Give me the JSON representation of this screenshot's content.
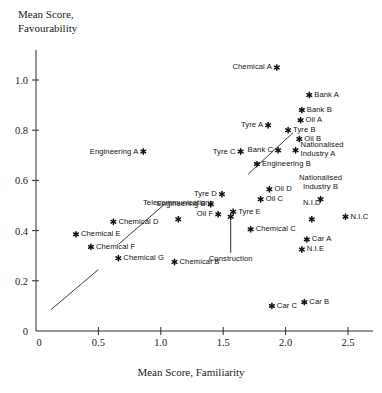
{
  "chart_data": {
    "type": "scatter",
    "title": "",
    "ylabel_line1": "Mean Score,",
    "ylabel_line2": "Favourability",
    "xlabel": "Mean Score, Familiarity",
    "xlim": [
      0,
      2.7
    ],
    "ylim": [
      0,
      1.12
    ],
    "xticks": [
      0,
      0.5,
      1.0,
      1.5,
      2.0,
      2.5
    ],
    "xtick_labels": [
      "0",
      "0.5",
      "1.0",
      "1.5",
      "2.0",
      "2.5"
    ],
    "yticks": [
      0,
      0.2,
      0.4,
      0.6,
      0.8,
      1.0
    ],
    "ytick_labels": [
      "0",
      "0.2",
      "0.4",
      "0.6",
      "0.8",
      "1.0"
    ],
    "grid": false,
    "legend": "none",
    "marker": "asterisk",
    "trend_line": {
      "style": "dashed",
      "note": "broken diagonal reference line from lower-left to upper-right"
    },
    "points": [
      {
        "label": "Chemical A",
        "x": 1.93,
        "y": 1.05,
        "lpos": "left"
      },
      {
        "label": "Bank A",
        "x": 2.19,
        "y": 0.94,
        "lpos": "right"
      },
      {
        "label": "Bank B",
        "x": 2.13,
        "y": 0.88,
        "lpos": "right"
      },
      {
        "label": "Oil A",
        "x": 2.12,
        "y": 0.84,
        "lpos": "right"
      },
      {
        "label": "Tyre B",
        "x": 2.02,
        "y": 0.8,
        "lpos": "right"
      },
      {
        "label": "Tyre A",
        "x": 1.86,
        "y": 0.82,
        "lpos": "left"
      },
      {
        "label": "Oil B",
        "x": 2.11,
        "y": 0.765,
        "lpos": "right"
      },
      {
        "label": "Bank C",
        "x": 1.94,
        "y": 0.72,
        "lpos": "left"
      },
      {
        "label": "Tyre C",
        "x": 1.64,
        "y": 0.715,
        "lpos": "left"
      },
      {
        "label": "Nationalised\nIndustry A",
        "x": 2.08,
        "y": 0.72,
        "lpos": "right"
      },
      {
        "label": "Engineering A",
        "x": 0.86,
        "y": 0.715,
        "lpos": "left"
      },
      {
        "label": "Engineering B",
        "x": 1.77,
        "y": 0.665,
        "lpos": "right"
      },
      {
        "label": "Oil D",
        "x": 1.87,
        "y": 0.565,
        "lpos": "right"
      },
      {
        "label": "Nationalised\nIndustry B",
        "x": 2.28,
        "y": 0.525,
        "lpos": "center"
      },
      {
        "label": "Tyre D",
        "x": 1.49,
        "y": 0.545,
        "lpos": "left"
      },
      {
        "label": "Oil C",
        "x": 1.8,
        "y": 0.525,
        "lpos": "right"
      },
      {
        "label": "Engineering B",
        "x": 1.4,
        "y": 0.505,
        "lpos": "left"
      },
      {
        "label": "Tyre E",
        "x": 1.58,
        "y": 0.475,
        "lpos": "right"
      },
      {
        "label": "N.I.C",
        "x": 2.48,
        "y": 0.455,
        "lpos": "right"
      },
      {
        "label": "Oil F",
        "x": 1.46,
        "y": 0.465,
        "lpos": "left"
      },
      {
        "label": "N.I.D",
        "x": 2.21,
        "y": 0.445,
        "lpos": "center"
      },
      {
        "label": "Telecommunications",
        "x": 1.14,
        "y": 0.445,
        "lpos": "center"
      },
      {
        "label": "Chemical D",
        "x": 0.62,
        "y": 0.435,
        "lpos": "right"
      },
      {
        "label": "Chemical C",
        "x": 1.72,
        "y": 0.405,
        "lpos": "right"
      },
      {
        "label": "Chemical E",
        "x": 0.32,
        "y": 0.385,
        "lpos": "right"
      },
      {
        "label": "Car A",
        "x": 2.17,
        "y": 0.365,
        "lpos": "right"
      },
      {
        "label": "Chemical F",
        "x": 0.44,
        "y": 0.335,
        "lpos": "right"
      },
      {
        "label": "N.I.E",
        "x": 2.13,
        "y": 0.325,
        "lpos": "right"
      },
      {
        "label": "Chemical G",
        "x": 0.66,
        "y": 0.29,
        "lpos": "right"
      },
      {
        "label": "Chemical B",
        "x": 1.11,
        "y": 0.275,
        "lpos": "right"
      },
      {
        "label": "Car C",
        "x": 1.89,
        "y": 0.1,
        "lpos": "right"
      },
      {
        "label": "Car B",
        "x": 2.15,
        "y": 0.115,
        "lpos": "right"
      },
      {
        "label": "Construction",
        "x": 1.56,
        "y": 0.455,
        "lpos": "leader"
      }
    ]
  }
}
